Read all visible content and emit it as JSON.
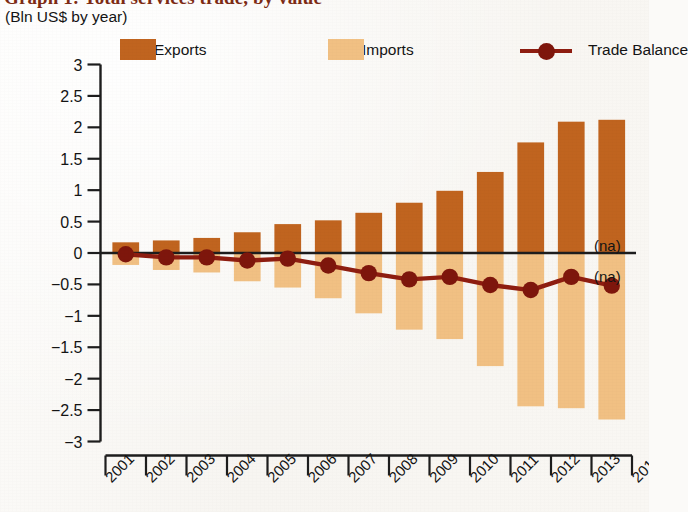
{
  "header": {
    "title": "Graph 1: Total services trade, by value",
    "subtitle": "(Bln US$ by year)"
  },
  "legend": {
    "position": "top",
    "items": [
      {
        "label": "Exports",
        "type": "bar",
        "color": "#C0641F"
      },
      {
        "label": "Imports",
        "type": "bar",
        "color": "#F1C083"
      },
      {
        "label": "Trade Balance",
        "type": "line",
        "color": "#8E1D10"
      }
    ]
  },
  "annotations": [
    {
      "text": "(na)",
      "x_year": 2014,
      "y_value": 0.12
    },
    {
      "text": "(na)",
      "x_year": 2014,
      "y_value": -0.37
    }
  ],
  "colors": {
    "exports": "#C0641F",
    "imports": "#F1C083",
    "trade_balance": "#8E1D10",
    "marker": "#7E160C",
    "axis": "#1D1D1D",
    "title": "#7D2B14",
    "background": "#FAF8F4"
  },
  "chart_data": {
    "type": "bar",
    "title": "Graph 1: Total services trade, by value",
    "subtitle": "(Bln US$ by year)",
    "xlabel": "",
    "ylabel": "",
    "ylim": [
      -3,
      3
    ],
    "ytick_labels": [
      "3",
      "2.5",
      "2",
      "1.5",
      "1",
      "0.5",
      "0",
      "−0.5",
      "−1",
      "−1.5",
      "−2",
      "−2.5",
      "−3"
    ],
    "ytick_values": [
      3,
      2.5,
      2,
      1.5,
      1,
      0.5,
      0,
      -0.5,
      -1,
      -1.5,
      -2,
      -2.5,
      -3
    ],
    "grid": false,
    "legend_position": "top",
    "categories": [
      "2001",
      "2002",
      "2003",
      "2004",
      "2005",
      "2006",
      "2007",
      "2008",
      "2009",
      "2010",
      "2011",
      "2012",
      "2013"
    ],
    "xtick_labels": [
      "2001",
      "2002",
      "2003",
      "2004",
      "2005",
      "2006",
      "2007",
      "2008",
      "2009",
      "2010",
      "2011",
      "2012",
      "2013",
      "2014"
    ],
    "series": [
      {
        "name": "Exports",
        "type": "bar",
        "color": "#C0641F",
        "values": [
          0.17,
          0.2,
          0.24,
          0.33,
          0.46,
          0.52,
          0.64,
          0.8,
          0.99,
          1.29,
          1.76,
          2.09,
          2.12
        ]
      },
      {
        "name": "Imports",
        "type": "bar",
        "color": "#F1C083",
        "values": [
          -0.19,
          -0.27,
          -0.31,
          -0.45,
          -0.55,
          -0.72,
          -0.96,
          -1.22,
          -1.37,
          -1.8,
          -2.44,
          -2.47,
          -2.65
        ]
      },
      {
        "name": "Trade Balance",
        "type": "line",
        "color": "#8E1D10",
        "values": [
          -0.02,
          -0.07,
          -0.07,
          -0.12,
          -0.09,
          -0.2,
          -0.32,
          -0.42,
          -0.38,
          -0.51,
          -0.59,
          -0.38,
          -0.52
        ]
      }
    ]
  }
}
